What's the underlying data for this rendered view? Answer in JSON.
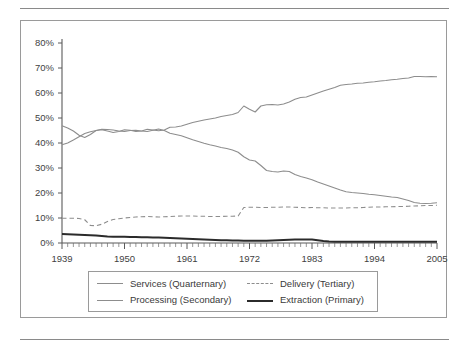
{
  "figure": {
    "frame_border_color": "#9a9a9a",
    "rule_color": "#8a8a8a",
    "background": "#ffffff"
  },
  "legend": {
    "position": "below-plot",
    "items": [
      {
        "label": "Services (Quarternary)",
        "style": "solid",
        "color": "#8d8d8d",
        "width": 1.1,
        "swatch": "solid-gray"
      },
      {
        "label": "Delivery (Tertiary)",
        "style": "dashed",
        "color": "#8d8d8d",
        "width": 1.1,
        "swatch": "dashed-gray"
      },
      {
        "label": "Processing (Secondary)",
        "style": "solid",
        "color": "#8d8d8d",
        "width": 1.1,
        "swatch": "solid-gray"
      },
      {
        "label": "Extraction (Primary)",
        "style": "solid",
        "color": "#2b2b2b",
        "width": 2.1,
        "swatch": "solid-black"
      }
    ]
  },
  "chart_data": {
    "type": "line",
    "title": "",
    "subtitle": "",
    "xlabel": "",
    "ylabel": "",
    "xlim": [
      1939,
      2005
    ],
    "ylim": [
      0,
      80
    ],
    "grid": false,
    "legend_position": "bottom",
    "y_ticks": [
      0,
      10,
      20,
      30,
      40,
      50,
      60,
      70,
      80
    ],
    "y_tick_labels": [
      "0%",
      "10%",
      "20%",
      "30%",
      "40%",
      "50%",
      "60%",
      "70%",
      "80%"
    ],
    "x_ticks": [
      1939,
      1950,
      1961,
      1972,
      1983,
      1994,
      2005
    ],
    "x_tick_labels": [
      "1939",
      "1950",
      "1961",
      "1972",
      "1983",
      "1994",
      "2005"
    ],
    "x_minor_tick_interval": 1,
    "x": [
      1939,
      1940,
      1941,
      1942,
      1943,
      1944,
      1945,
      1946,
      1947,
      1948,
      1949,
      1950,
      1951,
      1952,
      1953,
      1954,
      1955,
      1956,
      1957,
      1958,
      1959,
      1960,
      1961,
      1962,
      1963,
      1964,
      1965,
      1966,
      1967,
      1968,
      1969,
      1970,
      1971,
      1972,
      1973,
      1974,
      1975,
      1976,
      1977,
      1978,
      1979,
      1980,
      1981,
      1982,
      1983,
      1984,
      1985,
      1986,
      1987,
      1988,
      1989,
      1990,
      1991,
      1992,
      1993,
      1994,
      1995,
      1996,
      1997,
      1998,
      1999,
      2000,
      2001,
      2002,
      2003,
      2004,
      2005
    ],
    "series": [
      {
        "name": "Services (Quarternary)",
        "style": "solid",
        "color": "#8d8d8d",
        "width": 1.1,
        "values": [
          39.3,
          40.0,
          41.2,
          42.5,
          43.8,
          44.5,
          45.0,
          45.3,
          44.8,
          44.2,
          44.6,
          45.3,
          45.1,
          44.6,
          44.8,
          45.5,
          45.2,
          44.9,
          45.2,
          46.3,
          46.4,
          46.8,
          47.5,
          48.2,
          48.7,
          49.2,
          49.6,
          50.0,
          50.6,
          51.0,
          51.4,
          52.2,
          54.8,
          53.5,
          52.4,
          54.8,
          55.3,
          55.4,
          55.2,
          55.6,
          56.4,
          57.5,
          58.2,
          58.4,
          59.2,
          60.0,
          60.8,
          61.5,
          62.2,
          63.1,
          63.4,
          63.6,
          63.9,
          64.0,
          64.3,
          64.5,
          64.8,
          65.0,
          65.3,
          65.5,
          65.8,
          66.0,
          66.6,
          66.6,
          66.5,
          66.6,
          66.5
        ]
      },
      {
        "name": "Processing (Secondary)",
        "style": "solid",
        "color": "#8d8d8d",
        "width": 1.1,
        "values": [
          46.9,
          46.0,
          44.8,
          43.1,
          42.2,
          43.4,
          45.0,
          45.5,
          45.4,
          45.2,
          44.8,
          44.6,
          45.0,
          45.1,
          44.8,
          44.6,
          45.1,
          45.6,
          45.0,
          43.9,
          43.4,
          42.9,
          42.1,
          41.3,
          40.6,
          39.9,
          39.3,
          38.8,
          38.2,
          37.8,
          37.2,
          36.3,
          34.5,
          33.2,
          32.8,
          31.0,
          29.0,
          28.6,
          28.4,
          28.8,
          28.6,
          27.4,
          26.6,
          26.0,
          25.3,
          24.4,
          23.6,
          22.8,
          22.0,
          21.2,
          20.5,
          20.2,
          20.0,
          19.8,
          19.5,
          19.3,
          19.0,
          18.7,
          18.4,
          18.2,
          17.6,
          17.0,
          16.2,
          15.9,
          15.8,
          15.9,
          16.1
        ]
      },
      {
        "name": "Delivery (Tertiary)",
        "style": "dashed",
        "color": "#8d8d8d",
        "width": 1.1,
        "values": [
          9.9,
          9.9,
          9.9,
          9.8,
          9.3,
          7.0,
          6.9,
          7.5,
          8.6,
          9.4,
          9.7,
          10.0,
          10.2,
          10.4,
          10.5,
          10.6,
          10.5,
          10.4,
          10.5,
          10.6,
          10.7,
          10.8,
          10.8,
          10.8,
          10.7,
          10.7,
          10.6,
          10.6,
          10.6,
          10.7,
          10.7,
          10.8,
          14.2,
          14.3,
          14.3,
          14.2,
          14.2,
          14.3,
          14.3,
          14.4,
          14.4,
          14.3,
          14.2,
          14.1,
          14.2,
          14.1,
          14.1,
          14.0,
          14.0,
          14.0,
          14.0,
          14.1,
          14.1,
          14.2,
          14.3,
          14.4,
          14.4,
          14.5,
          14.5,
          14.6,
          14.6,
          14.7,
          14.8,
          14.9,
          15.0,
          15.0,
          15.1
        ]
      },
      {
        "name": "Extraction (Primary)",
        "style": "solid",
        "color": "#2b2b2b",
        "width": 2.1,
        "values": [
          3.6,
          3.5,
          3.4,
          3.3,
          3.2,
          3.1,
          3.0,
          2.8,
          2.6,
          2.5,
          2.5,
          2.5,
          2.4,
          2.4,
          2.3,
          2.3,
          2.2,
          2.2,
          2.1,
          2.0,
          1.9,
          1.8,
          1.7,
          1.6,
          1.5,
          1.4,
          1.3,
          1.2,
          1.1,
          1.1,
          1.0,
          1.0,
          0.9,
          0.9,
          0.9,
          0.9,
          0.9,
          1.0,
          1.1,
          1.2,
          1.3,
          1.4,
          1.4,
          1.4,
          1.4,
          1.1,
          0.8,
          0.6,
          0.5,
          0.5,
          0.5,
          0.5,
          0.5,
          0.5,
          0.5,
          0.5,
          0.5,
          0.5,
          0.5,
          0.5,
          0.5,
          0.5,
          0.5,
          0.5,
          0.5,
          0.5,
          0.5
        ]
      }
    ]
  }
}
